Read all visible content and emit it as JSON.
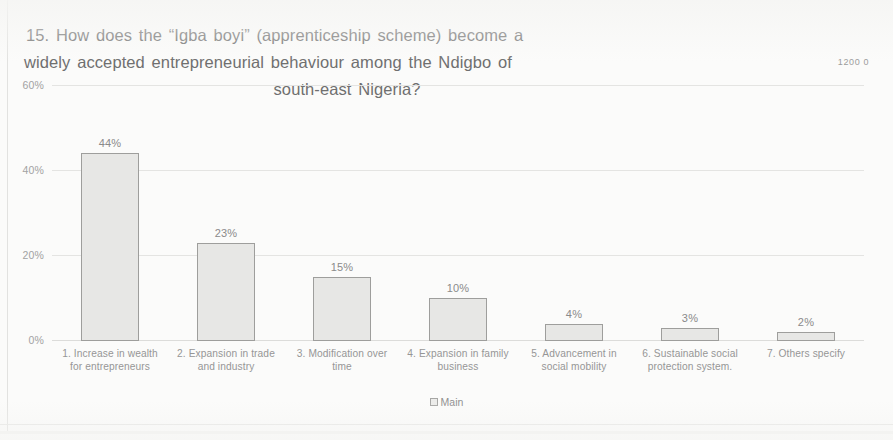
{
  "chart_data": {
    "type": "bar",
    "title": "15. How does the “Igba boyi” (apprenticeship scheme) become a widely accepted entrepreneurial behaviour among the Ndigbo of south-east Nigeria?",
    "title_lines": [
      "15. How does the “Igba boyi” (apprenticeship scheme) become a",
      "widely accepted entrepreneurial behaviour among the Ndigbo of",
      "south-east Nigeria?"
    ],
    "categories": [
      "1. Increase in wealth for entrepreneurs",
      "2. Expansion in trade and industry",
      "3. Modification over time",
      "4. Expansion in family business",
      "5. Advancement in social mobility",
      "6. Sustainable social protection system.",
      "7. Others specify"
    ],
    "values": [
      44,
      23,
      15,
      10,
      4,
      3,
      2
    ],
    "data_labels": [
      "44%",
      "23%",
      "15%",
      "10%",
      "4%",
      "3%",
      "2%"
    ],
    "series": [
      {
        "name": "Main",
        "values": [
          44,
          23,
          15,
          10,
          4,
          3,
          2
        ]
      }
    ],
    "xlabel": "",
    "ylabel": "",
    "ylim": [
      0,
      60
    ],
    "ytick_labels": [
      "60%",
      "40%",
      "20%",
      "0%"
    ],
    "ytick_values": [
      60,
      40,
      20,
      0
    ],
    "grid": true,
    "legend": {
      "position": "bottom",
      "entries": [
        "Main"
      ]
    },
    "colors": {
      "bar_fill": "#e7e7e5",
      "bar_border": "#9e9e9c",
      "gridline": "#e4e4e2",
      "text": "#8d8d8d",
      "background": "#fbfbfa"
    }
  },
  "artifact": {
    "corner_text": "1200 0"
  }
}
